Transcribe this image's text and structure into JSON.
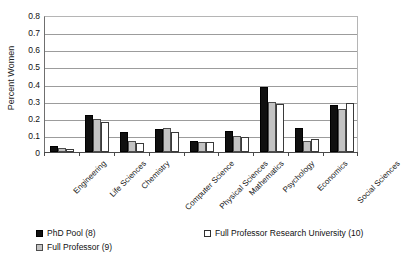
{
  "chart_data": {
    "type": "bar",
    "title": "",
    "xlabel": "",
    "ylabel": "Percent Women",
    "ylim": [
      0,
      0.8
    ],
    "ytick_labels": [
      "0.8",
      "0.7",
      "0.6",
      "0.5",
      "0.4",
      "0.3",
      "0.2",
      "0.1",
      "0"
    ],
    "ytick_values": [
      0.8,
      0.7,
      0.6,
      0.5,
      0.4,
      0.3,
      0.2,
      0.1,
      0
    ],
    "grid": true,
    "legend_position": "bottom-left",
    "categories": [
      "Engineering",
      "Life Sciences",
      "Chemistry",
      "Computer Science",
      "Physical Sciences",
      "Mathematics",
      "Psychology",
      "Economics",
      "Social Sciences"
    ],
    "series": [
      {
        "name": "PhD Pool (8)",
        "color": "#101010",
        "values": [
          0.035,
          0.215,
          0.115,
          0.135,
          0.065,
          0.12,
          0.38,
          0.14,
          0.275
        ]
      },
      {
        "name": "Full Professor (9)",
        "color": "#c3c3c3",
        "values": [
          0.025,
          0.19,
          0.065,
          0.14,
          0.06,
          0.095,
          0.29,
          0.065,
          0.25
        ]
      },
      {
        "name": "Full Professor Research University (10)",
        "color": "#ffffff",
        "values": [
          0.015,
          0.175,
          0.05,
          0.115,
          0.06,
          0.09,
          0.28,
          0.075,
          0.285
        ]
      }
    ]
  }
}
